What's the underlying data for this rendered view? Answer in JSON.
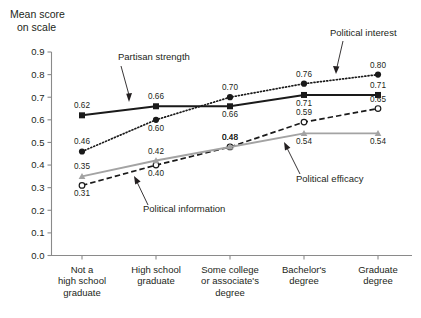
{
  "chart_data": {
    "type": "line",
    "title": "",
    "xlabel": "",
    "ylabel": "Mean score on scale",
    "ylabel_line1": "Mean score",
    "ylabel_line2": "on scale",
    "ylim": [
      0.0,
      0.9
    ],
    "grid": false,
    "legend": "inline-annotations",
    "categories": [
      "Not a high school graduate",
      "High school graduate",
      "Some college or associate's degree",
      "Bachelor's degree",
      "Graduate degree"
    ],
    "categories_wrapped": [
      [
        "Not a",
        "high school",
        "graduate"
      ],
      [
        "High school",
        "graduate"
      ],
      [
        "Some college",
        "or associate's",
        "degree"
      ],
      [
        "Bachelor's",
        "degree"
      ],
      [
        "Graduate",
        "degree"
      ]
    ],
    "yticks": [
      "0.0",
      "0.1",
      "0.2",
      "0.3",
      "0.4",
      "0.5",
      "0.6",
      "0.7",
      "0.8",
      "0.9"
    ],
    "ytick_values": [
      0.0,
      0.1,
      0.2,
      0.3,
      0.4,
      0.5,
      0.6,
      0.7,
      0.8,
      0.9
    ],
    "series": [
      {
        "name": "Partisan strength",
        "values": [
          0.62,
          0.66,
          0.66,
          0.71,
          0.71
        ],
        "labels": [
          "0.62",
          "0.66",
          "0.66",
          "0.71",
          "0.71"
        ],
        "color": "#1a1a1a",
        "line_style": "solid",
        "marker": "filled-square"
      },
      {
        "name": "Political interest",
        "values": [
          0.46,
          0.6,
          0.7,
          0.76,
          0.8
        ],
        "labels": [
          "0.46",
          "0.60",
          "0.70",
          "0.76",
          "0.80"
        ],
        "color": "#1a1a1a",
        "line_style": "dotted",
        "marker": "filled-circle"
      },
      {
        "name": "Political information",
        "values": [
          0.31,
          0.4,
          0.48,
          0.59,
          0.65
        ],
        "labels": [
          "0.31",
          "0.40",
          "0.48",
          "0.59",
          "0.65"
        ],
        "color": "#1a1a1a",
        "line_style": "dashed",
        "marker": "open-circle"
      },
      {
        "name": "Political efficacy",
        "values": [
          0.35,
          0.42,
          0.48,
          0.54,
          0.54
        ],
        "labels": [
          "0.35",
          "0.42",
          "0.48",
          "0.54",
          "0.54"
        ],
        "color": "#a3a3a3",
        "line_style": "solid",
        "marker": "filled-triangle"
      }
    ],
    "annotations": [
      {
        "text": "Partisan strength",
        "target_series": "Partisan strength"
      },
      {
        "text": "Political interest",
        "target_series": "Political interest"
      },
      {
        "text": "Political information",
        "target_series": "Political information"
      },
      {
        "text": "Political efficacy",
        "target_series": "Political efficacy"
      }
    ]
  },
  "colors": {
    "axis": "#8a8a8a",
    "text": "#231f20",
    "black_series": "#1a1a1a",
    "gray_series": "#a3a3a3",
    "background": "#ffffff"
  }
}
